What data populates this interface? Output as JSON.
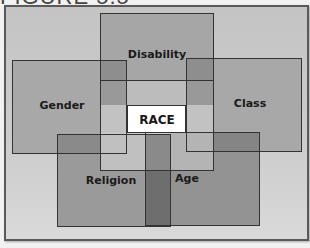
{
  "figure": {
    "title": "FIGURE 5.5"
  },
  "diagram": {
    "center": "RACE",
    "categories": [
      "Disability",
      "Gender",
      "Class",
      "Religion",
      "Age"
    ],
    "labels": {
      "disability": "Disability",
      "gender": "Gender",
      "class": "Class",
      "race": "RACE",
      "religion": "Religion",
      "age": "Age"
    },
    "colors": {
      "background": "#c8c8c8",
      "box": "#a3a3a3",
      "overlap": "#8c8c8c",
      "race_band": "#bdbdbd",
      "race_center": "#ffffff",
      "dark_strip": "#707070",
      "border": "#333333"
    }
  }
}
